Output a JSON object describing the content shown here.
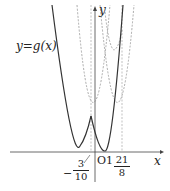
{
  "labels": {
    "function": "y=g(x)",
    "y_axis": "y",
    "x_axis": "x",
    "origin": "O",
    "tick_one": "1",
    "neg_sign": "−",
    "left_frac_num": "3",
    "left_frac_den": "10",
    "right_frac_num": "21",
    "right_frac_den": "8"
  },
  "colors": {
    "solid": "#333333",
    "dashed": "#888888",
    "axis": "#444444"
  }
}
